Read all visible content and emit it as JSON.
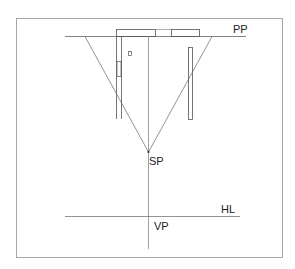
{
  "diagram": {
    "type": "perspective-plan-view",
    "labels": {
      "picture_plane": "PP",
      "station_point": "SP",
      "horizon_line": "HL",
      "vanishing_point": "VP"
    },
    "colors": {
      "line": "#555555",
      "frame": "#9a9a9a",
      "text": "#222222",
      "background": "#ffffff"
    }
  }
}
